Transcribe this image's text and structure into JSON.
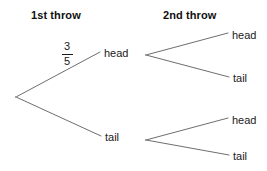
{
  "diagram": {
    "type": "probability-tree",
    "headers": {
      "first": "1st throw",
      "second": "2nd throw"
    },
    "probability_label": {
      "numerator": "3",
      "denominator": "5"
    },
    "first_throw": {
      "head": "head",
      "tail": "tail"
    },
    "second_throw_from_head": {
      "head": "head",
      "tail": "tail"
    },
    "second_throw_from_tail": {
      "head": "head",
      "tail": "tail"
    },
    "colors": {
      "line": "#6e6e6e",
      "text": "#1a1a1a",
      "background": "#ffffff"
    }
  }
}
